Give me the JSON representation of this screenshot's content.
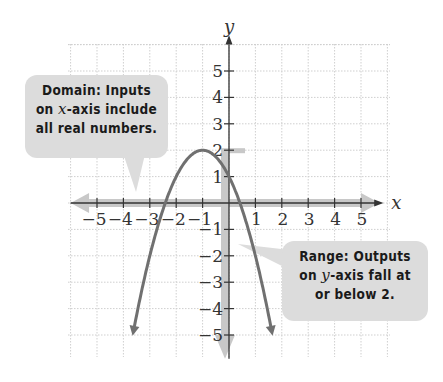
{
  "chart_data": {
    "type": "line",
    "title": "",
    "xlabel": "x",
    "ylabel": "y",
    "xlim": [
      -5,
      5
    ],
    "ylim": [
      -5,
      5
    ],
    "grid": true,
    "x_ticks": [
      -5,
      -4,
      -3,
      -2,
      -1,
      1,
      2,
      3,
      4,
      5
    ],
    "y_ticks": [
      -5,
      -4,
      -3,
      -2,
      -1,
      1,
      2,
      3,
      4,
      5
    ],
    "series": [
      {
        "name": "parabola",
        "equation": "y = -(x+1)^2 + 2",
        "vertex": [
          -1,
          2
        ],
        "y_intercept": 1,
        "x_intercepts": [
          -2.41,
          0.41
        ],
        "x": [
          -3.6,
          -3,
          -2.41,
          -2,
          -1,
          0,
          0.41,
          1,
          1.6
        ],
        "values": [
          -4.76,
          -2,
          0,
          1,
          2,
          1,
          0,
          -2,
          -4.76
        ],
        "color": "#707070"
      }
    ],
    "annotations": [
      {
        "id": "domain",
        "text": "Domain: Inputs on x-axis include all real numbers."
      },
      {
        "id": "range",
        "text": "Range: Outputs on y-axis fall at or below 2."
      }
    ]
  },
  "labels": {
    "x_axis": "x",
    "y_axis": "y",
    "domain_line1": "Domain: Inputs",
    "domain_line2_pre": "on ",
    "domain_line2_var": "x",
    "domain_line2_post": "-axis include",
    "domain_line3": "all real numbers.",
    "range_line1": "Range: Outputs",
    "range_line2_pre": "on ",
    "range_line2_var": "y",
    "range_line2_post": "-axis fall at",
    "range_line3": "or below 2."
  },
  "colors": {
    "curve": "#707070",
    "highlight": "#c8c8c8",
    "callout_bg": "#dcdcdc",
    "axis": "#333333",
    "grid": "#cfcfcf"
  }
}
